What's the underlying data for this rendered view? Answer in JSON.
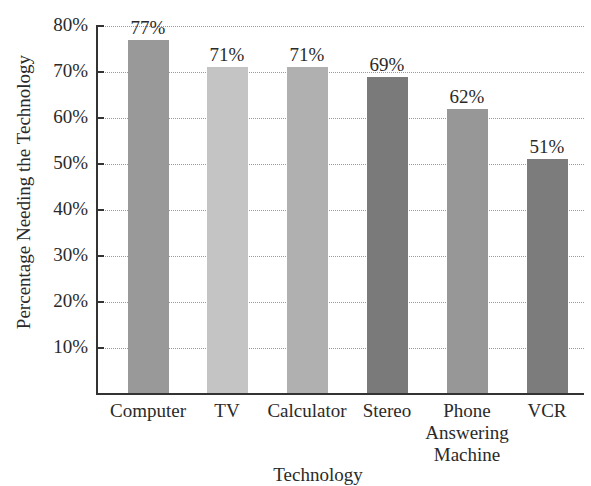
{
  "chart_data": {
    "type": "bar",
    "title": "",
    "xlabel": "Technology",
    "ylabel": "Percentage Needing the Technology",
    "categories": [
      "Computer",
      "TV",
      "Calculator",
      "Stereo",
      "Phone Answering Machine",
      "VCR"
    ],
    "values": [
      77,
      71,
      71,
      69,
      62,
      51
    ],
    "value_labels": [
      "77%",
      "71%",
      "71%",
      "69%",
      "62%",
      "51%"
    ],
    "bar_colors": [
      "#999999",
      "#c4c4c4",
      "#b0b0b0",
      "#7a7a7a",
      "#979797",
      "#7c7c7c"
    ],
    "ylim": [
      0,
      80
    ],
    "yticks": [
      10,
      20,
      30,
      40,
      50,
      60,
      70,
      80
    ],
    "ytick_labels": [
      "10%",
      "20%",
      "30%",
      "40%",
      "50%",
      "60%",
      "70%",
      "80%"
    ],
    "grid": "horizontal dotted",
    "legend": null
  },
  "labels": {
    "xlabel": "Technology",
    "ylabel": "Percentage Needing the Technology",
    "categories": [
      "Computer",
      "TV",
      "Calculator",
      "Stereo",
      "Phone\nAnswering\nMachine",
      "VCR"
    ]
  }
}
